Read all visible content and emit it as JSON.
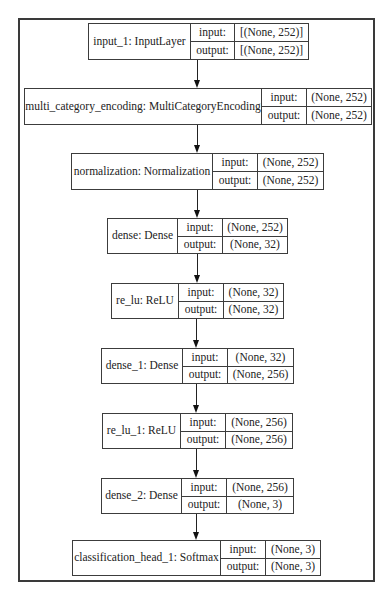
{
  "diagram": {
    "type": "keras-model-plot",
    "nodes": [
      {
        "id": "input_1",
        "label": "input_1: InputLayer",
        "input_label": "input:",
        "output_label": "output:",
        "input_shape": "[(None, 252)]",
        "output_shape": "[(None, 252)]"
      },
      {
        "id": "multi_category_encoding",
        "label": "multi_category_encoding: MultiCategoryEncoding",
        "input_label": "input:",
        "output_label": "output:",
        "input_shape": "(None, 252)",
        "output_shape": "(None, 252)"
      },
      {
        "id": "normalization",
        "label": "normalization: Normalization",
        "input_label": "input:",
        "output_label": "output:",
        "input_shape": "(None, 252)",
        "output_shape": "(None, 252)"
      },
      {
        "id": "dense",
        "label": "dense: Dense",
        "input_label": "input:",
        "output_label": "output:",
        "input_shape": "(None, 252)",
        "output_shape": "(None, 32)"
      },
      {
        "id": "re_lu",
        "label": "re_lu: ReLU",
        "input_label": "input:",
        "output_label": "output:",
        "input_shape": "(None, 32)",
        "output_shape": "(None, 32)"
      },
      {
        "id": "dense_1",
        "label": "dense_1: Dense",
        "input_label": "input:",
        "output_label": "output:",
        "input_shape": "(None, 32)",
        "output_shape": "(None, 256)"
      },
      {
        "id": "re_lu_1",
        "label": "re_lu_1: ReLU",
        "input_label": "input:",
        "output_label": "output:",
        "input_shape": "(None, 256)",
        "output_shape": "(None, 256)"
      },
      {
        "id": "dense_2",
        "label": "dense_2: Dense",
        "input_label": "input:",
        "output_label": "output:",
        "input_shape": "(None, 256)",
        "output_shape": "(None, 3)"
      },
      {
        "id": "classification_head_1",
        "label": "classification_head_1: Softmax",
        "input_label": "input:",
        "output_label": "output:",
        "input_shape": "(None, 3)",
        "output_shape": "(None, 3)"
      }
    ],
    "edges": [
      {
        "from": "input_1",
        "to": "multi_category_encoding"
      },
      {
        "from": "multi_category_encoding",
        "to": "normalization"
      },
      {
        "from": "normalization",
        "to": "dense"
      },
      {
        "from": "dense",
        "to": "re_lu"
      },
      {
        "from": "re_lu",
        "to": "dense_1"
      },
      {
        "from": "dense_1",
        "to": "re_lu_1"
      },
      {
        "from": "re_lu_1",
        "to": "dense_2"
      },
      {
        "from": "dense_2",
        "to": "classification_head_1"
      }
    ]
  }
}
